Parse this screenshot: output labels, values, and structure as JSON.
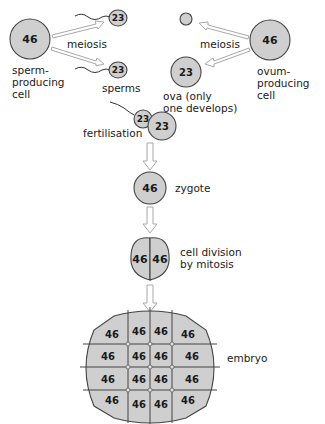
{
  "diagram": {
    "type": "flow",
    "colors": {
      "cell_fill": "#cfcfcf",
      "cell_stroke": "#444444",
      "arrow": "#a8a8a8",
      "text": "#1a1a1a",
      "background": "#ffffff"
    },
    "male": {
      "parent_cell": {
        "chromosomes": "46",
        "label_lines": [
          "sperm-",
          "producing",
          "cell"
        ]
      },
      "process_label": "meiosis",
      "sperm": [
        {
          "chromosomes": "23"
        },
        {
          "chromosomes": "23"
        }
      ],
      "sperm_label": "sperms"
    },
    "female": {
      "parent_cell": {
        "chromosomes": "46",
        "label_lines": [
          "ovum-",
          "producing",
          "cell"
        ]
      },
      "process_label": "meiosis",
      "polar_body": {
        "chromosomes": ""
      },
      "ovum": {
        "chromosomes": "23",
        "label_lines": [
          "ova (only",
          "one develops)"
        ]
      }
    },
    "fertilisation": {
      "label": "fertilisation",
      "sperm_chromosomes": "23",
      "ovum_chromosomes": "23"
    },
    "zygote": {
      "chromosomes": "46",
      "label": "zygote"
    },
    "division": {
      "cells": [
        "46",
        "46"
      ],
      "label_lines": [
        "cell division",
        "by mitosis"
      ]
    },
    "embryo": {
      "label": "embryo",
      "grid": [
        [
          "46",
          "46",
          "46",
          "46"
        ],
        [
          "46",
          "46",
          "46",
          "46"
        ],
        [
          "46",
          "46",
          "46",
          "46"
        ],
        [
          "46",
          "46",
          "46",
          "46"
        ]
      ]
    }
  }
}
